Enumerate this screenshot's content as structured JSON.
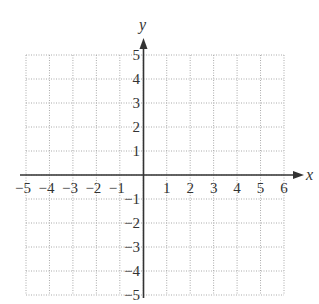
{
  "chart_data": {
    "type": "grid",
    "title": "",
    "xlabel": "x",
    "ylabel": "y",
    "xlim": [
      -5,
      6
    ],
    "ylim": [
      -5,
      5
    ],
    "grid": true,
    "grid_style": "dotted",
    "x_ticks": [
      "−5",
      "−4",
      "−3",
      "−2",
      "−1",
      "1",
      "2",
      "3",
      "4",
      "5",
      "6"
    ],
    "y_ticks": [
      "5",
      "4",
      "3",
      "2",
      "1",
      "−1",
      "−2",
      "−3",
      "−4",
      "−5"
    ]
  },
  "axes": {
    "x_label": "x",
    "y_label": "y",
    "color": "#333333",
    "grid_color": "#aaaaaa"
  }
}
